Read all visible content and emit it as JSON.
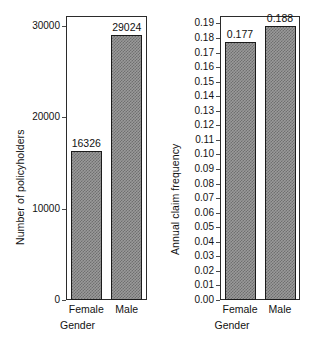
{
  "figure": {
    "background": "#ffffff",
    "bar_fill": "#9a9a9a",
    "bar_edge": "#1c1c1c"
  },
  "chart_data": [
    {
      "type": "bar",
      "title": "",
      "xlabel": "Gender",
      "ylabel": "Number of policyholders",
      "categories": [
        "Female",
        "Male"
      ],
      "values": [
        16326,
        29024
      ],
      "value_labels": [
        "16326",
        "29024"
      ],
      "ylim": [
        0,
        31100
      ],
      "yticks": [
        0,
        10000,
        20000,
        30000
      ],
      "ytick_labels": [
        "0",
        "10000",
        "20000",
        "30000"
      ],
      "grid": false,
      "legend": null
    },
    {
      "type": "bar",
      "title": "",
      "xlabel": "Gender",
      "ylabel": "Annual claim frequency",
      "categories": [
        "Female",
        "Male"
      ],
      "values": [
        0.177,
        0.188
      ],
      "value_labels": [
        "0.177",
        "0.188"
      ],
      "ylim": [
        0.0,
        0.1951
      ],
      "yticks": [
        0.0,
        0.01,
        0.02,
        0.03,
        0.04,
        0.05,
        0.06,
        0.07,
        0.08,
        0.09,
        0.1,
        0.11,
        0.12,
        0.13,
        0.14,
        0.15,
        0.16,
        0.17,
        0.18,
        0.19
      ],
      "ytick_labels": [
        "0.00",
        "0.01",
        "0.02",
        "0.03",
        "0.04",
        "0.05",
        "0.06",
        "0.07",
        "0.08",
        "0.09",
        "0.10",
        "0.11",
        "0.12",
        "0.13",
        "0.14",
        "0.15",
        "0.16",
        "0.17",
        "0.18",
        "0.19"
      ],
      "grid": false,
      "legend": null
    }
  ]
}
